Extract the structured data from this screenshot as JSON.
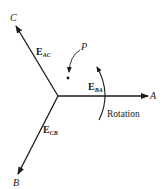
{
  "diagram": {
    "axes": [
      {
        "id": "A",
        "label": "A"
      },
      {
        "id": "B",
        "label": "B"
      },
      {
        "id": "C",
        "label": "C"
      }
    ],
    "phasors": [
      {
        "id": "E_AC",
        "main": "E",
        "sub": "AC"
      },
      {
        "id": "E_BA",
        "main": "E",
        "sub": "BA"
      },
      {
        "id": "E_CB",
        "main": "E",
        "sub": "CB"
      }
    ],
    "point_label": "P",
    "rotation_label": "Rotation",
    "colors": {
      "stroke": "#1a1a1a",
      "background": "#ffffff"
    }
  }
}
